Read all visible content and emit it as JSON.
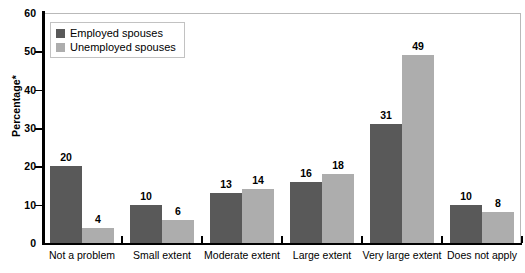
{
  "chart_data": {
    "type": "bar",
    "title": "",
    "subtitle": "",
    "xlabel": "",
    "ylabel": "Percentage*",
    "ylim": [
      0,
      60
    ],
    "yticks": [
      0,
      10,
      20,
      30,
      40,
      50,
      60
    ],
    "grid": false,
    "legend_position": "top-left",
    "categories": [
      "Not a problem",
      "Small extent",
      "Moderate extent",
      "Large extent",
      "Very large extent",
      "Does not apply"
    ],
    "series": [
      {
        "name": "Employed spouses",
        "color": "#595959",
        "values": [
          20,
          10,
          13,
          16,
          31,
          10
        ]
      },
      {
        "name": "Unemployed spouses",
        "color": "#adadad",
        "values": [
          4,
          6,
          14,
          18,
          49,
          8
        ]
      }
    ]
  },
  "axes": {
    "y_title": "Percentage*",
    "y_tick_labels": [
      "0",
      "10",
      "20",
      "30",
      "40",
      "50",
      "60"
    ],
    "x_tick_labels": [
      "Not a problem",
      "Small extent",
      "Moderate extent",
      "Large extent",
      "Very large extent",
      "Does not apply"
    ]
  },
  "legend": {
    "entries": [
      {
        "label": "Employed spouses",
        "swatch": "#595959"
      },
      {
        "label": "Unemployed spouses",
        "swatch": "#adadad"
      }
    ]
  },
  "data_labels": {
    "series0": [
      "20",
      "10",
      "13",
      "16",
      "31",
      "10"
    ],
    "series1": [
      "4",
      "6",
      "14",
      "18",
      "49",
      "8"
    ]
  }
}
